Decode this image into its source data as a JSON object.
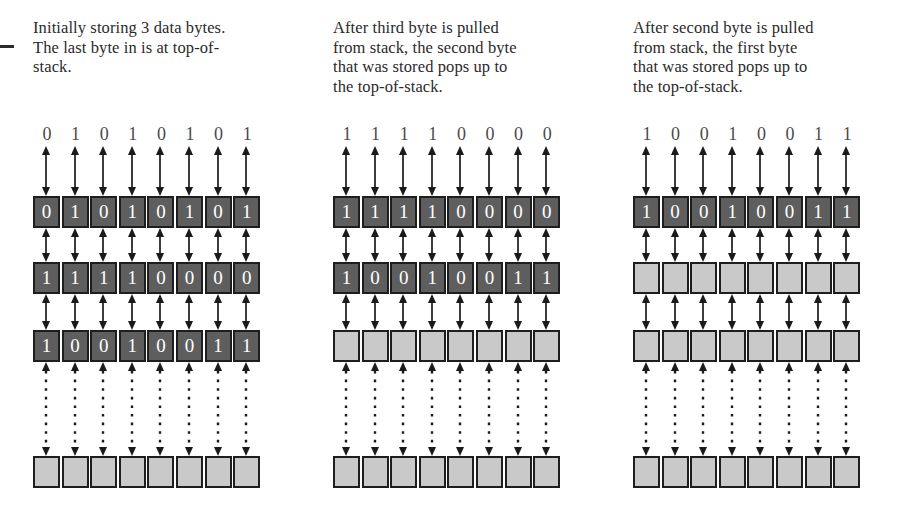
{
  "figure": {
    "type": "stack-memory-diagram",
    "colors": {
      "filled_cell": "#5e5e5e",
      "empty_cell": "#c9c9c9",
      "cell_border": "#1e1e1e",
      "arrow": "#1a1a1a",
      "text": "#2a2a2a",
      "bit_label": "#4a4a4a",
      "background": "#ffffff"
    },
    "bit_width": 8,
    "stack_depth_shown": 4
  },
  "panels": [
    {
      "caption_lines": [
        "Initially storing 3 data bytes.",
        "The last byte in is at top-of-",
        "stack."
      ],
      "bit_labels": [
        "0",
        "1",
        "0",
        "1",
        "0",
        "1",
        "0",
        "1"
      ],
      "rows": [
        {
          "filled": true,
          "bits": [
            "0",
            "1",
            "0",
            "1",
            "0",
            "1",
            "0",
            "1"
          ]
        },
        {
          "filled": true,
          "bits": [
            "1",
            "1",
            "1",
            "1",
            "0",
            "0",
            "0",
            "0"
          ]
        },
        {
          "filled": true,
          "bits": [
            "1",
            "0",
            "0",
            "1",
            "0",
            "0",
            "1",
            "1"
          ]
        },
        {
          "filled": false,
          "bits": [
            "",
            "",
            "",
            "",
            "",
            "",
            "",
            ""
          ]
        }
      ],
      "dashed_gap_before_row": 3
    },
    {
      "caption_lines": [
        "After third byte is pulled",
        "from stack, the second byte",
        "that was stored pops up to",
        "the top-of-stack."
      ],
      "bit_labels": [
        "1",
        "1",
        "1",
        "1",
        "0",
        "0",
        "0",
        "0"
      ],
      "rows": [
        {
          "filled": true,
          "bits": [
            "1",
            "1",
            "1",
            "1",
            "0",
            "0",
            "0",
            "0"
          ]
        },
        {
          "filled": true,
          "bits": [
            "1",
            "0",
            "0",
            "1",
            "0",
            "0",
            "1",
            "1"
          ]
        },
        {
          "filled": false,
          "bits": [
            "",
            "",
            "",
            "",
            "",
            "",
            "",
            ""
          ]
        },
        {
          "filled": false,
          "bits": [
            "",
            "",
            "",
            "",
            "",
            "",
            "",
            ""
          ]
        }
      ],
      "dashed_gap_before_row": 3
    },
    {
      "caption_lines": [
        "After second byte is pulled",
        "from stack, the first byte",
        "that was stored pops up to",
        "the top-of-stack."
      ],
      "bit_labels": [
        "1",
        "0",
        "0",
        "1",
        "0",
        "0",
        "1",
        "1"
      ],
      "rows": [
        {
          "filled": true,
          "bits": [
            "1",
            "0",
            "0",
            "1",
            "0",
            "0",
            "1",
            "1"
          ]
        },
        {
          "filled": false,
          "bits": [
            "",
            "",
            "",
            "",
            "",
            "",
            "",
            ""
          ]
        },
        {
          "filled": false,
          "bits": [
            "",
            "",
            "",
            "",
            "",
            "",
            "",
            ""
          ]
        },
        {
          "filled": false,
          "bits": [
            "",
            "",
            "",
            "",
            "",
            "",
            "",
            ""
          ]
        }
      ],
      "dashed_gap_before_row": 3
    }
  ]
}
